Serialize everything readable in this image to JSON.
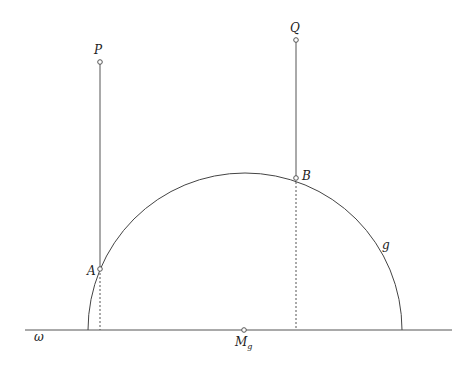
{
  "diagram": {
    "line_label": "ω",
    "curve_label": "g",
    "center_label": "M",
    "center_subscript": "g",
    "points": {
      "P": {
        "label": "P"
      },
      "Q": {
        "label": "Q"
      },
      "A": {
        "label": "A"
      },
      "B": {
        "label": "B"
      }
    },
    "colors": {
      "stroke": "#555555",
      "point_fill": "#ffffff"
    }
  }
}
